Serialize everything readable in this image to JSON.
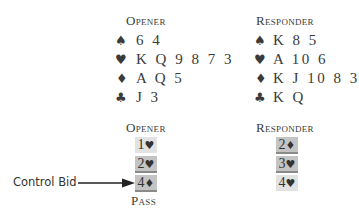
{
  "hands": {
    "opener": {
      "title": "Opener",
      "rows": [
        {
          "suit": "♠",
          "cards": "6 4"
        },
        {
          "suit": "♥",
          "cards": "K Q 9 8 7 3"
        },
        {
          "suit": "♦",
          "cards": "A Q 5"
        },
        {
          "suit": "♣",
          "cards": "J 3"
        }
      ]
    },
    "responder": {
      "title": "Responder",
      "rows": [
        {
          "suit": "♠",
          "cards": "K 8 5"
        },
        {
          "suit": "♥",
          "cards": "A 10 6"
        },
        {
          "suit": "♦",
          "cards": "K J 10 8 3"
        },
        {
          "suit": "♣",
          "cards": "K Q"
        }
      ]
    }
  },
  "auction": {
    "opener": {
      "title": "Opener",
      "bids": [
        {
          "level": "1",
          "suit": "♥",
          "shade": "light"
        },
        {
          "level": "2",
          "suit": "♥",
          "shade": "dark"
        },
        {
          "level": "4",
          "suit": "♦",
          "shade": "dark"
        }
      ],
      "final": "Pass"
    },
    "responder": {
      "title": "Responder",
      "bids": [
        {
          "level": "2",
          "suit": "♦",
          "shade": "dark"
        },
        {
          "level": "3",
          "suit": "♥",
          "shade": "dark"
        },
        {
          "level": "4",
          "suit": "♥",
          "shade": "light"
        }
      ]
    }
  },
  "annotation": {
    "label": "Control Bid",
    "points_to": "4♦"
  },
  "colors": {
    "text": "#3a3a3a",
    "shade_light": "#e2e2e2",
    "shade_dark": "#c4c4c4",
    "underline": "#8a8a8a"
  }
}
